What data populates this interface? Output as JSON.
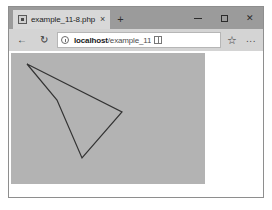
{
  "window": {
    "tab": {
      "favicon_name": "page-favicon-icon",
      "title": "example_11-8.php",
      "close_label": "×"
    },
    "new_tab_label": "+",
    "controls": {
      "minimize_label": "–",
      "maximize_label": "□",
      "close_label": "✕"
    }
  },
  "toolbar": {
    "back_label": "←",
    "refresh_label": "↻",
    "address": {
      "host": "localhost",
      "path": "/example_11",
      "info_icon": "site-info-icon",
      "reading_view_icon": "reading-view-icon"
    },
    "favorites_label": "☆",
    "more_label": "∙∙∙"
  },
  "page": {
    "image": {
      "background_color": "#b3b3b3",
      "stroke_color": "#333333",
      "width": 194,
      "height": 131,
      "polygon_points": "16,11 111,59 71,105 46,47"
    }
  }
}
